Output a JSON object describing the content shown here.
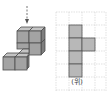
{
  "figure": {
    "view_arrow": "down-arrow",
    "solid": {
      "description": "3D arrangement of unit cubes viewed from above-front",
      "cube_color": "#9a9a9a",
      "edge_color": "#555555"
    },
    "top_view": {
      "label": "(위)",
      "grid_cols": 4,
      "grid_rows": 6,
      "shaded_cells": [
        [
          1,
          1
        ],
        [
          1,
          2
        ],
        [
          2,
          2
        ],
        [
          1,
          3
        ],
        [
          1,
          4
        ]
      ],
      "shade_color": "#b8b8b8",
      "grid_line_color": "#cfcfcf"
    }
  }
}
